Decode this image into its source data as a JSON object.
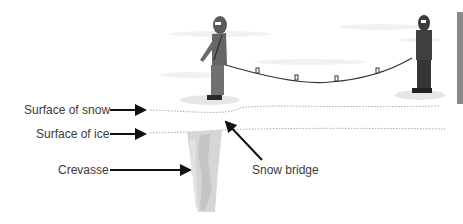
{
  "diagram": {
    "labels": {
      "surface_of_snow": "Surface of snow",
      "surface_of_ice": "Surface of ice",
      "crevasse": "Crevasse",
      "snow_bridge": "Snow bridge"
    },
    "figures": [
      "climber-left",
      "climber-right"
    ],
    "rope_knots": 4,
    "colors": {
      "text": "#3a3a3a",
      "arrow": "#111111",
      "climber": "#555555",
      "crevasse": "#cfcfcf",
      "side_bar": "#8a8a8a"
    }
  }
}
